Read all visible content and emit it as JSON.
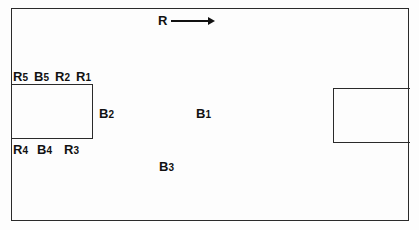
{
  "diagram": {
    "direction_label": "R",
    "direction_arrow": "right-arrow",
    "labels": {
      "r5": {
        "main": "R",
        "sub": "5"
      },
      "b5": {
        "main": "B",
        "sub": "5"
      },
      "r2": {
        "main": "R",
        "sub": "2"
      },
      "r1": {
        "main": "R",
        "sub": "1"
      },
      "r4": {
        "main": "R",
        "sub": "4"
      },
      "b4": {
        "main": "B",
        "sub": "4"
      },
      "r3": {
        "main": "R",
        "sub": "3"
      },
      "b2": {
        "main": "B",
        "sub": "2"
      },
      "b1": {
        "main": "B",
        "sub": "1"
      },
      "b3": {
        "main": "B",
        "sub": "3"
      }
    }
  }
}
